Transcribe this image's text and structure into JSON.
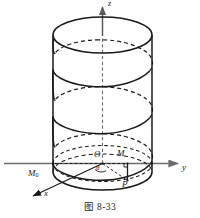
{
  "figure": {
    "caption": "图 8-33",
    "axes": {
      "z_label": "z",
      "y_label": "y",
      "x_label": "x"
    },
    "points": {
      "origin_label": "O",
      "point_m_label": "M",
      "point_p_label": "P",
      "point_m0_label": "M",
      "point_m0_subscript": "0",
      "angle_label": "θ"
    },
    "colors": {
      "curve": "#1a1a1a",
      "axis": "#6b6b6b",
      "hidden": "#1a1a1a",
      "background": "#ffffff"
    },
    "geometry": {
      "cylinder_left_x": 53,
      "cylinder_right_x": 152,
      "cylinder_top_y": 35,
      "cylinder_bottom_y": 172,
      "ellipse_rx": 49.5,
      "ellipse_ry": 18,
      "center_x": 102.5,
      "helix_turns": 3
    }
  }
}
